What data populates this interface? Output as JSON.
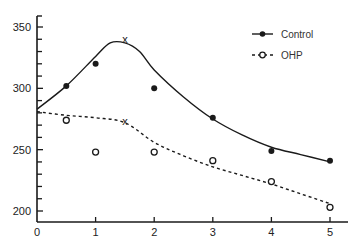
{
  "chart_data": {
    "type": "line",
    "title": "",
    "xlabel": "",
    "ylabel": "",
    "xlim": [
      0,
      5.3
    ],
    "ylim": [
      190,
      358
    ],
    "xticks": [
      0,
      1,
      2,
      3,
      4,
      5
    ],
    "xtick_labels": [
      "0",
      "1",
      "2",
      "3",
      "4",
      "5"
    ],
    "yticks_major": [
      200,
      250,
      300,
      350
    ],
    "ytick_labels": [
      "200",
      "250",
      "300",
      "350"
    ],
    "yticks_minor_step": 10,
    "grid": false,
    "legend_position": "top-right",
    "series": [
      {
        "name": "Control",
        "marker": "filled-circle",
        "line_style": "solid",
        "color": "#1a1a1a",
        "points": [
          {
            "x": 0.5,
            "y": 302
          },
          {
            "x": 1,
            "y": 320
          },
          {
            "x": 2,
            "y": 300
          },
          {
            "x": 3,
            "y": 276
          },
          {
            "x": 4,
            "y": 249
          },
          {
            "x": 5,
            "y": 241
          }
        ],
        "fit_curve": [
          {
            "x": 0,
            "y": 283
          },
          {
            "x": 0.5,
            "y": 302
          },
          {
            "x": 1,
            "y": 326
          },
          {
            "x": 1.25,
            "y": 337
          },
          {
            "x": 1.5,
            "y": 337
          },
          {
            "x": 1.75,
            "y": 330
          },
          {
            "x": 2,
            "y": 315
          },
          {
            "x": 2.5,
            "y": 293
          },
          {
            "x": 3,
            "y": 275
          },
          {
            "x": 3.5,
            "y": 262
          },
          {
            "x": 4,
            "y": 252
          },
          {
            "x": 4.5,
            "y": 246
          },
          {
            "x": 5,
            "y": 240
          }
        ],
        "peak_marker": {
          "x": 1.5,
          "y": 340,
          "symbol": "x"
        }
      },
      {
        "name": "OHP",
        "marker": "open-circle",
        "line_style": "dashed",
        "color": "#1a1a1a",
        "points": [
          {
            "x": 0.5,
            "y": 274
          },
          {
            "x": 1,
            "y": 248
          },
          {
            "x": 2,
            "y": 248
          },
          {
            "x": 3,
            "y": 241
          },
          {
            "x": 4,
            "y": 224
          },
          {
            "x": 5,
            "y": 203
          }
        ],
        "fit_curve": [
          {
            "x": 0,
            "y": 281
          },
          {
            "x": 0.5,
            "y": 278
          },
          {
            "x": 1,
            "y": 276
          },
          {
            "x": 1.5,
            "y": 272
          },
          {
            "x": 2,
            "y": 256
          },
          {
            "x": 2.5,
            "y": 245
          },
          {
            "x": 3,
            "y": 236
          },
          {
            "x": 3.5,
            "y": 229
          },
          {
            "x": 4,
            "y": 222
          },
          {
            "x": 4.5,
            "y": 214
          },
          {
            "x": 5,
            "y": 206
          }
        ],
        "peak_marker": {
          "x": 1.5,
          "y": 273,
          "symbol": "x"
        }
      }
    ]
  }
}
